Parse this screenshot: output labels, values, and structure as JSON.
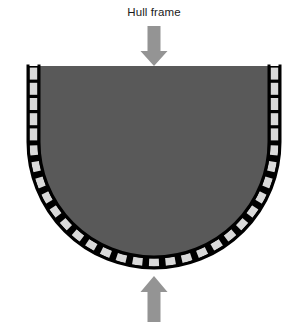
{
  "diagram": {
    "title": "Hull frame",
    "type": "hull-frame-cross-section"
  },
  "colors": {
    "background": "#ffffff",
    "hull_fill": "#595959",
    "segment_fill": "#d9d9d9",
    "outline": "#000000",
    "arrow_fill": "#949494",
    "title_text": "#1a1a1a"
  },
  "geometry": {
    "view_width": 308,
    "view_height": 328,
    "center_x": 154,
    "top_y": 66,
    "straight_bottom_y": 142,
    "radius_outer": 126,
    "band_thickness": 11,
    "outline_width": 3,
    "side_segments_per_side": 5,
    "arc_segments": 23,
    "segment_gap_deg": 1.6
  },
  "arrows": {
    "top": {
      "label": "downward-load-arrow",
      "direction": "down",
      "x": 154,
      "tip_y": 66,
      "tail_y": 26,
      "shaft_width": 13,
      "head_width": 27,
      "head_height": 15
    },
    "bottom": {
      "label": "upward-reaction-arrow",
      "direction": "up",
      "x": 154,
      "tip_y": 276,
      "tail_y": 322,
      "shaft_width": 13,
      "head_width": 27,
      "head_height": 16
    }
  },
  "labels": {
    "hull_body": "hull-plating",
    "frame_band": "frame-segment-band"
  }
}
